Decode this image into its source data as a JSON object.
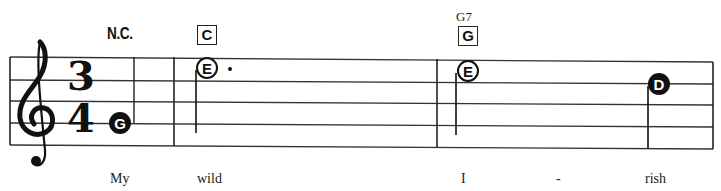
{
  "score": {
    "clef": "treble",
    "clef_icon": "treble-clef-icon",
    "time_signature": {
      "numerator": "3",
      "denominator": "4"
    },
    "chords": [
      {
        "label": "N.C.",
        "type": "text"
      },
      {
        "label": "C",
        "type": "boxed"
      },
      {
        "label": "G",
        "type": "boxed",
        "name": "G7"
      }
    ],
    "notes": [
      {
        "letter": "G",
        "style": "filled",
        "duration": "quarter"
      },
      {
        "letter": "E",
        "style": "open",
        "duration": "dotted half"
      },
      {
        "letter": "E",
        "style": "open",
        "duration": "half"
      },
      {
        "letter": "D",
        "style": "filled",
        "duration": "quarter"
      }
    ],
    "lyrics": [
      "My",
      "wild",
      "I",
      "-",
      "rish"
    ]
  }
}
